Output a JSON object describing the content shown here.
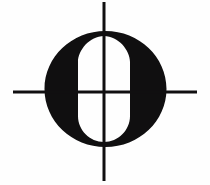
{
  "image": {
    "kind": "logo-emblem",
    "title": "Crosshair O emblem",
    "description": "Black filled ellipse with a white vertical capsule counter forming the letter O, overlaid by a thin black crosshair registration mark",
    "width": 210,
    "height": 185,
    "background_color": "#fefefe",
    "ink_color": "#100f10",
    "counter_color": "#ffffff"
  },
  "glyph": {
    "character": "O",
    "name": "letter-o-disk",
    "disk": {
      "center_x": 105.5,
      "center_y": 89,
      "radius_x": 61,
      "radius_y": 58
    },
    "counter": {
      "name": "inner-capsule-counter",
      "center_x": 104,
      "center_y": 89,
      "radius_x": 26,
      "radius_y": 53,
      "corner_radius": 26
    }
  },
  "crosshair": {
    "name": "registration-crosshair",
    "stroke_color": "#100f10",
    "stroke_width": 3,
    "vertical": {
      "x": 104,
      "y_start": 2,
      "y_end": 181
    },
    "horizontal": {
      "y": 92,
      "x_start": 13,
      "x_end": 197
    }
  }
}
